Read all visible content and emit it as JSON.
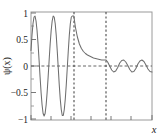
{
  "chart_data": {
    "type": "line",
    "title": "",
    "xlabel": "x",
    "ylabel": "ψ(x)",
    "xlim": [
      0,
      12
    ],
    "ylim": [
      -1.08,
      1.08
    ],
    "grid": false,
    "legend": null,
    "y_ticks": [
      {
        "value": 1,
        "label": "1"
      },
      {
        "value": 0.5,
        "label": "0.5"
      },
      {
        "value": 0,
        "label": "0"
      },
      {
        "value": -0.5,
        "label": "−0.5"
      },
      {
        "value": -1,
        "label": "−1"
      }
    ],
    "y_minor_ticks": [
      0.75,
      0.25,
      -0.25,
      -0.75
    ],
    "x_ticks": [
      {
        "value": 0,
        "label": ""
      },
      {
        "value": 2,
        "label": ""
      },
      {
        "value": 4,
        "label": ""
      },
      {
        "value": 6,
        "label": ""
      },
      {
        "value": 8,
        "label": ""
      },
      {
        "value": 10,
        "label": ""
      },
      {
        "value": 12,
        "label": ""
      }
    ],
    "annotations": [
      {
        "kind": "vline",
        "name": "barrier-left-edge",
        "x": 4.25,
        "style": "dashed",
        "color": "#555555"
      },
      {
        "kind": "vline",
        "name": "barrier-right-edge",
        "x": 7.45,
        "style": "dashed",
        "color": "#555555"
      },
      {
        "kind": "hline",
        "name": "zero-level",
        "y": 0,
        "style": "dashed",
        "color": "#555555"
      }
    ],
    "series": [
      {
        "name": "wavefunction",
        "color": "#6e6e6e",
        "linewidth": 1.0,
        "description": "Quantum tunneling wavefunction: free oscillation (amplitude 1), exponential decay inside barrier, small transmitted oscillation (amplitude 0.12)",
        "x": [
          0.0,
          0.1,
          0.2,
          0.3,
          0.4,
          0.5,
          0.6,
          0.7,
          0.8,
          0.9,
          1.0,
          1.1,
          1.2,
          1.3,
          1.4,
          1.5,
          1.6,
          1.7,
          1.8,
          1.9,
          2.0,
          2.1,
          2.2,
          2.3,
          2.4,
          2.5,
          2.6,
          2.7,
          2.8,
          2.9,
          3.0,
          3.1,
          3.2,
          3.3,
          3.4,
          3.5,
          3.6,
          3.7,
          3.8,
          3.9,
          4.0,
          4.1,
          4.25,
          4.4,
          4.6,
          4.8,
          5.0,
          5.2,
          5.4,
          5.6,
          5.8,
          6.0,
          6.2,
          6.4,
          6.6,
          6.8,
          7.0,
          7.2,
          7.45,
          7.6,
          7.8,
          8.0,
          8.2,
          8.4,
          8.6,
          8.8,
          9.0,
          9.2,
          9.4,
          9.6,
          9.8,
          10.0,
          10.2,
          10.4,
          10.6,
          10.8,
          11.0,
          11.2,
          11.4,
          11.6,
          11.8,
          12.0
        ],
        "y": [
          0.31,
          0.62,
          0.85,
          0.98,
          1.0,
          0.9,
          0.71,
          0.44,
          0.12,
          -0.22,
          -0.53,
          -0.78,
          -0.95,
          -1.0,
          -0.95,
          -0.78,
          -0.53,
          -0.22,
          0.12,
          0.44,
          0.71,
          0.9,
          1.0,
          0.98,
          0.85,
          0.62,
          0.31,
          -0.03,
          -0.37,
          -0.66,
          -0.87,
          -0.99,
          -0.99,
          -0.87,
          -0.66,
          -0.37,
          -0.03,
          0.31,
          0.62,
          0.85,
          0.98,
          1.0,
          1.0,
          0.78,
          0.58,
          0.44,
          0.35,
          0.29,
          0.25,
          0.22,
          0.2,
          0.18,
          0.16,
          0.15,
          0.14,
          0.13,
          0.12,
          0.12,
          0.12,
          0.08,
          0.0,
          -0.08,
          -0.12,
          -0.1,
          -0.03,
          0.06,
          0.11,
          0.12,
          0.08,
          0.01,
          -0.07,
          -0.12,
          -0.11,
          -0.05,
          0.04,
          0.1,
          0.12,
          0.09,
          0.02,
          -0.06,
          -0.11,
          -0.12
        ]
      }
    ]
  },
  "figure": {
    "background_color": "#ffffff",
    "axis_color": "#8a8a8a",
    "curve_color": "#6e6e6e",
    "dash_color": "#555555",
    "text_color": "#1a1a1a"
  }
}
